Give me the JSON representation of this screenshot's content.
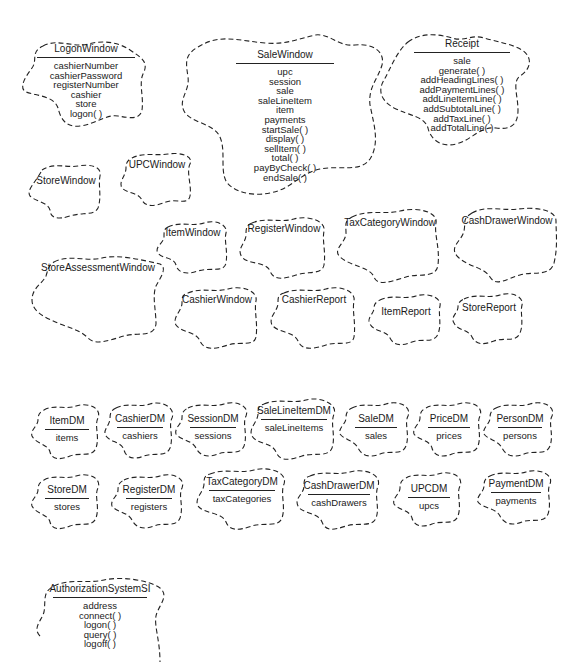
{
  "diagram": {
    "notation": "Booch class clouds (dashed outline)",
    "classes": {
      "logonWindow": {
        "name": "LogonWindow",
        "members": [
          "cashierNumber",
          "cashierPassword",
          "registerNumber",
          "cashier",
          "store",
          "logon( )"
        ]
      },
      "saleWindow": {
        "name": "SaleWindow",
        "members": [
          "upc",
          "session",
          "sale",
          "saleLineItem",
          "item",
          "payments",
          "startSale( )",
          "display( )",
          "sellItem( )",
          "total( )",
          "payByCheck( )",
          "endSale( )"
        ]
      },
      "receipt": {
        "name": "Receipt",
        "members": [
          "sale",
          "generate( )",
          "addHeadingLines( )",
          "addPaymentLines( )",
          "addLineItemLine( )",
          "addSubtotalLine( )",
          "addTaxLine( )",
          "addTotalLine( )"
        ]
      },
      "storeWindow": {
        "name": "StoreWindow"
      },
      "upcWindow": {
        "name": "UPCWindow"
      },
      "itemWindow": {
        "name": "ItemWindow"
      },
      "registerWindow": {
        "name": "RegisterWindow"
      },
      "taxCategoryWindow": {
        "name": "TaxCategoryWindow"
      },
      "cashDrawerWindow": {
        "name": "CashDrawerWindow"
      },
      "storeAssessmentWindow": {
        "name": "StoreAssessmentWindow"
      },
      "cashierWindow": {
        "name": "CashierWindow"
      },
      "cashierReport": {
        "name": "CashierReport"
      },
      "itemReport": {
        "name": "ItemReport"
      },
      "storeReport": {
        "name": "StoreReport"
      },
      "itemDM": {
        "name": "ItemDM",
        "members": [
          "items"
        ]
      },
      "cashierDM": {
        "name": "CashierDM",
        "members": [
          "cashiers"
        ]
      },
      "sessionDM": {
        "name": "SessionDM",
        "members": [
          "sessions"
        ]
      },
      "saleLineItemDM": {
        "name": "SaleLineItemDM",
        "members": [
          "saleLineItems"
        ]
      },
      "saleDM": {
        "name": "SaleDM",
        "members": [
          "sales"
        ]
      },
      "priceDM": {
        "name": "PriceDM",
        "members": [
          "prices"
        ]
      },
      "personDM": {
        "name": "PersonDM",
        "members": [
          "persons"
        ]
      },
      "storeDM": {
        "name": "StoreDM",
        "members": [
          "stores"
        ]
      },
      "registerDM": {
        "name": "RegisterDM",
        "members": [
          "registers"
        ]
      },
      "taxCategoryDM": {
        "name": "TaxCategoryDM",
        "members": [
          "taxCategories"
        ]
      },
      "cashDrawerDM": {
        "name": "CashDrawerDM",
        "members": [
          "cashDrawers"
        ]
      },
      "upcDM": {
        "name": "UPCDM",
        "members": [
          "upcs"
        ]
      },
      "paymentDM": {
        "name": "PaymentDM",
        "members": [
          "payments"
        ]
      },
      "authorizationSystemSI": {
        "name": "AuthorizationSystemSI",
        "members": [
          "address",
          "connect( )",
          "logon( )",
          "query( )",
          "logoff( )"
        ]
      }
    }
  }
}
